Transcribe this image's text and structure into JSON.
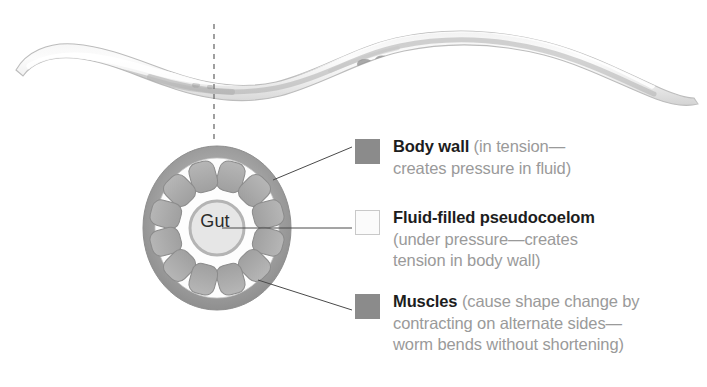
{
  "figure": {
    "organism": "nematode worm",
    "section_marker": "dashed cross-section line"
  },
  "cross_section": {
    "gut_label": "Gut",
    "body_wall_color": "#9a9a9a",
    "muscle_color": "#a8a8a8",
    "pseudocoelom_color": "#fdfdfd",
    "gut_color": "#e2e2e2"
  },
  "legend": {
    "items": [
      {
        "term": "Body wall",
        "description": " (in tension—\ncreates pressure in fluid)",
        "swatch": "solid-gray-swatch",
        "swatch_color": "#8b8b8b"
      },
      {
        "term": "Fluid-filled pseudocoelom",
        "description": "\n(under pressure—creates\ntension in body wall)",
        "swatch": "hollow-white-swatch",
        "swatch_color": "#fbfbfb"
      },
      {
        "term": "Muscles",
        "description": " (cause shape change by\ncontracting on alternate sides—\nworm bends without shortening)",
        "swatch": "solid-gray-swatch",
        "swatch_color": "#8b8b8b"
      }
    ]
  }
}
